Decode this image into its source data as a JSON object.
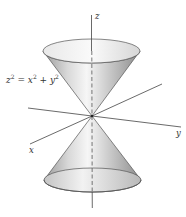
{
  "figure": {
    "type": "double cone",
    "equation": "z² = x² + y²",
    "equation_parts": {
      "lhs": "z",
      "lhs_exp": "2",
      "eq": " = ",
      "x": "x",
      "x_exp": "2",
      "plus": " + ",
      "y": "y",
      "y_exp": "2"
    },
    "axes": {
      "x": "x",
      "y": "y",
      "z": "z"
    },
    "colors": {
      "surface_light": "#f4f4f4",
      "surface_mid": "#bdbdbd",
      "surface_dark": "#8a8a8a",
      "outline": "#555555",
      "axis": "#444444"
    }
  }
}
